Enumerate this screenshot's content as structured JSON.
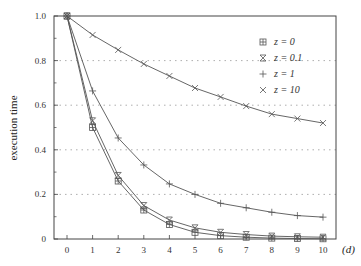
{
  "chart_data": {
    "type": "line",
    "title": "",
    "xlabel": "(d)",
    "ylabel": "execution time",
    "x": [
      0,
      1,
      2,
      3,
      4,
      5,
      6,
      7,
      8,
      9,
      10
    ],
    "xlim": [
      -0.5,
      10.5
    ],
    "ylim": [
      0,
      1.0
    ],
    "xticks": [
      "0",
      "1",
      "2",
      "3",
      "4",
      "5",
      "6",
      "7",
      "8",
      "9",
      "10"
    ],
    "yticks": [
      "0",
      "0.2",
      "0.4",
      "0.6",
      "0.8",
      "1.0"
    ],
    "ytick_values": [
      0,
      0.2,
      0.4,
      0.6,
      0.8,
      1.0
    ],
    "grid": "horizontal-dotted",
    "legend_position": "top-right",
    "series": [
      {
        "name": "z = 0",
        "marker": "boxed-plus",
        "values": [
          1.0,
          0.5,
          0.26,
          0.13,
          0.065,
          0.03,
          0.015,
          0.008,
          0.004,
          0.002,
          0.001
        ]
      },
      {
        "name": "z = 0.1",
        "marker": "hourglass",
        "values": [
          1.0,
          0.53,
          0.285,
          0.15,
          0.085,
          0.05,
          0.03,
          0.02,
          0.013,
          0.01,
          0.008
        ]
      },
      {
        "name": "z = 1",
        "marker": "plus",
        "values": [
          1.0,
          0.664,
          0.453,
          0.332,
          0.247,
          0.2,
          0.16,
          0.14,
          0.12,
          0.105,
          0.098
        ]
      },
      {
        "name": "z = 10",
        "marker": "cross",
        "values": [
          1.0,
          0.915,
          0.848,
          0.785,
          0.731,
          0.677,
          0.637,
          0.596,
          0.56,
          0.54,
          0.52
        ]
      }
    ]
  }
}
